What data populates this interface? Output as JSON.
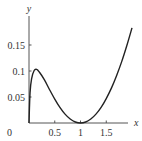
{
  "chart_data": {
    "type": "line",
    "title": "",
    "xlabel": "x",
    "ylabel": "y",
    "xlim": [
      0,
      2.0
    ],
    "ylim": [
      0,
      0.19
    ],
    "grid": false,
    "legend": null,
    "x_ticks": [
      0.5,
      1,
      1.5
    ],
    "x_tick_labels": [
      "0.5",
      "1",
      "1.5"
    ],
    "y_ticks": [
      0.05,
      0.1,
      0.15
    ],
    "y_tick_labels": [
      "0.05",
      "0.1",
      "0.15"
    ],
    "origin_label": "0",
    "series": [
      {
        "name": "y",
        "x": [
          0.0,
          0.02,
          0.05,
          0.1,
          0.15,
          0.2,
          0.3,
          0.4,
          0.5,
          0.6,
          0.7,
          0.8,
          0.9,
          1.0,
          1.1,
          1.2,
          1.3,
          1.4,
          1.5,
          1.6,
          1.7,
          1.8,
          1.9,
          2.0
        ],
        "values": [
          0.0,
          0.058,
          0.085,
          0.101,
          0.103,
          0.098,
          0.083,
          0.064,
          0.046,
          0.03,
          0.017,
          0.0076,
          0.0019,
          0.0,
          0.0019,
          0.0076,
          0.017,
          0.03,
          0.047,
          0.067,
          0.091,
          0.118,
          0.149,
          0.183
        ]
      }
    ]
  }
}
